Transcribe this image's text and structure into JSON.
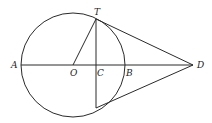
{
  "diagram": {
    "type": "geometry",
    "labels": {
      "T": "T",
      "A": "A",
      "O": "O",
      "C": "C",
      "B": "B",
      "D": "D"
    },
    "colors": {
      "stroke": "#2a2a2a",
      "background": "#ffffff"
    }
  }
}
